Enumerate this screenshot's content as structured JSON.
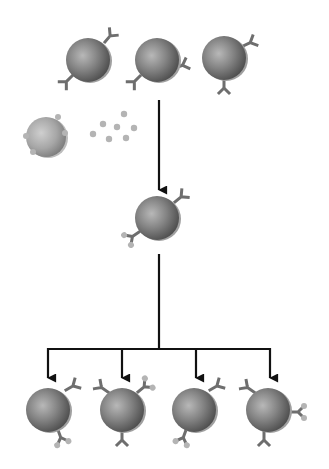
{
  "diagram": {
    "title": "",
    "colors": {
      "background": "#ffffff",
      "cell_dark": "#5a5a5a",
      "cell_mid": "#8a8a8a",
      "cell_light": "#c8c8c8",
      "receptor": "#6e6e6e",
      "antigen": "#b4b4b4",
      "arrow": "#111111"
    },
    "top_row_cells": [
      {
        "cx": 88,
        "cy": 60,
        "receptors": [
          {
            "x": 111,
            "y": 35,
            "angle": -35
          },
          {
            "x": 66,
            "y": 82,
            "angle": 225
          }
        ]
      },
      {
        "cx": 157,
        "cy": 60,
        "receptors": [
          {
            "x": 182,
            "y": 73,
            "angle": 30
          },
          {
            "x": 133,
            "y": 82,
            "angle": 225
          }
        ]
      },
      {
        "cx": 224,
        "cy": 58,
        "receptors": [
          {
            "x": 248,
            "y": 38,
            "angle": -20
          },
          {
            "x": 224,
            "y": 88,
            "angle": 90
          }
        ]
      }
    ],
    "antigen_cell": {
      "cx": 46,
      "cy": 137,
      "r": 20
    },
    "antigen_particles": [
      {
        "x": 124,
        "y": 114
      },
      {
        "x": 103,
        "y": 124
      },
      {
        "x": 117,
        "y": 127
      },
      {
        "x": 134,
        "y": 128
      },
      {
        "x": 93,
        "y": 134
      },
      {
        "x": 109,
        "y": 139
      },
      {
        "x": 126,
        "y": 138
      }
    ],
    "activated_cell": {
      "cx": 157,
      "cy": 218
    },
    "daughter_cells": [
      {
        "cx": 48,
        "cy": 410
      },
      {
        "cx": 122,
        "cy": 410
      },
      {
        "cx": 194,
        "cy": 410
      },
      {
        "cx": 268,
        "cy": 410
      }
    ],
    "arrows": [
      {
        "from": [
          159,
          100
        ],
        "to": [
          159,
          190
        ]
      },
      {
        "branch_y": 349,
        "stem_from": [
          159,
          254
        ],
        "branch_x": [
          48,
          122,
          196,
          270
        ],
        "arrow_to_y": 378
      }
    ]
  }
}
